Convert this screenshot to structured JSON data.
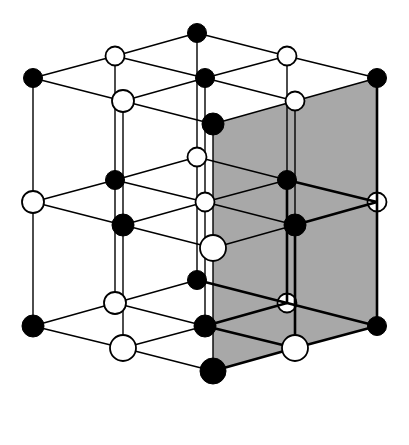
{
  "figure": {
    "name": "rock-salt-cubic-lattice",
    "background_color": "#ffffff",
    "width": 409,
    "height": 445
  },
  "style": {
    "black_node_color": "#000000",
    "white_node_fill": "#ffffff",
    "node_stroke_color": "#000000",
    "shaded_face_color": "#a8a8a8",
    "edge_color": "#000000",
    "edge_width_front": 2.6,
    "edge_width_back": 1.4,
    "node_radius_front": 13,
    "node_radius_mid": 11,
    "node_radius_back": 9.5
  },
  "chart_data": {
    "type": "scatter",
    "xlabel": "",
    "ylabel": "",
    "projection": "isometric",
    "grid_dimensions": [
      3,
      3,
      3
    ],
    "node_count": 27,
    "black_node_count": 14,
    "white_node_count": 13,
    "coloring_rule": "black when (i+j+k) is even, white when (i+j+k) is odd",
    "shaded_faces": [
      {
        "name": "right-front-outer-face",
        "plane": "i = 2",
        "color": "#a8a8a8",
        "corners": [
          [
            2,
            0,
            0
          ],
          [
            2,
            2,
            0
          ],
          [
            2,
            2,
            2
          ],
          [
            2,
            0,
            2
          ]
        ]
      }
    ],
    "projection_basis": {
      "origin_px": [
        197,
        33
      ],
      "unit_i_px": [
        90,
        22.5
      ],
      "unit_j_px": [
        -82,
        22.5
      ],
      "unit_k_px": [
        0,
        123.5
      ]
    },
    "nodes": [
      {
        "ijk": [
          0,
          0,
          0
        ],
        "px": [
          197,
          33
        ],
        "color": "black",
        "layer": "back"
      },
      {
        "ijk": [
          1,
          0,
          0
        ],
        "px": [
          287,
          56
        ],
        "color": "white",
        "layer": "back"
      },
      {
        "ijk": [
          2,
          0,
          0
        ],
        "px": [
          377,
          78
        ],
        "color": "black",
        "layer": "back"
      },
      {
        "ijk": [
          0,
          1,
          0
        ],
        "px": [
          115,
          56
        ],
        "color": "white",
        "layer": "back"
      },
      {
        "ijk": [
          1,
          1,
          0
        ],
        "px": [
          205,
          78
        ],
        "color": "black",
        "layer": "back"
      },
      {
        "ijk": [
          2,
          1,
          0
        ],
        "px": [
          295,
          101
        ],
        "color": "white",
        "layer": "back"
      },
      {
        "ijk": [
          0,
          2,
          0
        ],
        "px": [
          33,
          78
        ],
        "color": "black",
        "layer": "back"
      },
      {
        "ijk": [
          1,
          2,
          0
        ],
        "px": [
          123,
          101
        ],
        "color": "white",
        "layer": "mid"
      },
      {
        "ijk": [
          2,
          2,
          0
        ],
        "px": [
          213,
          124
        ],
        "color": "black",
        "layer": "mid"
      },
      {
        "ijk": [
          0,
          0,
          1
        ],
        "px": [
          197,
          157
        ],
        "color": "white",
        "layer": "back"
      },
      {
        "ijk": [
          1,
          0,
          1
        ],
        "px": [
          287,
          180
        ],
        "color": "black",
        "layer": "back"
      },
      {
        "ijk": [
          2,
          0,
          1
        ],
        "px": [
          377,
          202
        ],
        "color": "white",
        "layer": "back"
      },
      {
        "ijk": [
          0,
          1,
          1
        ],
        "px": [
          115,
          180
        ],
        "color": "black",
        "layer": "back"
      },
      {
        "ijk": [
          1,
          1,
          1
        ],
        "px": [
          205,
          202
        ],
        "color": "white",
        "layer": "back"
      },
      {
        "ijk": [
          2,
          1,
          1
        ],
        "px": [
          295,
          225
        ],
        "color": "black",
        "layer": "mid"
      },
      {
        "ijk": [
          0,
          2,
          1
        ],
        "px": [
          33,
          202
        ],
        "color": "white",
        "layer": "mid"
      },
      {
        "ijk": [
          1,
          2,
          1
        ],
        "px": [
          123,
          225
        ],
        "color": "black",
        "layer": "mid"
      },
      {
        "ijk": [
          2,
          2,
          1
        ],
        "px": [
          213,
          248
        ],
        "color": "white",
        "layer": "front"
      },
      {
        "ijk": [
          0,
          0,
          2
        ],
        "px": [
          197,
          280
        ],
        "color": "black",
        "layer": "back"
      },
      {
        "ijk": [
          1,
          0,
          2
        ],
        "px": [
          287,
          303
        ],
        "color": "white",
        "layer": "back"
      },
      {
        "ijk": [
          2,
          0,
          2
        ],
        "px": [
          377,
          326
        ],
        "color": "black",
        "layer": "back"
      },
      {
        "ijk": [
          0,
          1,
          2
        ],
        "px": [
          115,
          303
        ],
        "color": "white",
        "layer": "mid"
      },
      {
        "ijk": [
          1,
          1,
          2
        ],
        "px": [
          205,
          326
        ],
        "color": "black",
        "layer": "mid"
      },
      {
        "ijk": [
          2,
          1,
          2
        ],
        "px": [
          295,
          348
        ],
        "color": "white",
        "layer": "front"
      },
      {
        "ijk": [
          0,
          2,
          2
        ],
        "px": [
          33,
          326
        ],
        "color": "black",
        "layer": "mid"
      },
      {
        "ijk": [
          1,
          2,
          2
        ],
        "px": [
          123,
          348
        ],
        "color": "white",
        "layer": "front"
      },
      {
        "ijk": [
          2,
          2,
          2
        ],
        "px": [
          213,
          371
        ],
        "color": "black",
        "layer": "front"
      }
    ],
    "legend": [
      {
        "label": "cation",
        "marker": "filled-circle",
        "color": "#000000"
      },
      {
        "label": "anion",
        "marker": "open-circle",
        "color": "#ffffff"
      }
    ],
    "annotations": []
  }
}
